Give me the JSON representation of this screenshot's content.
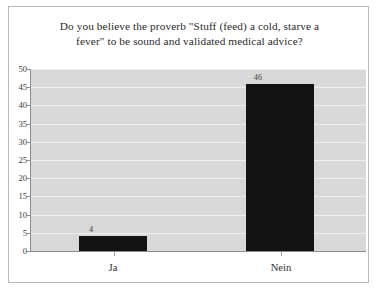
{
  "chart_data": {
    "type": "bar",
    "title": "Do you believe the proverb \"Stuff (feed) a cold, starve a fever\" to be sound and validated medical advice?",
    "title_lines": [
      "Do you believe the proverb \"Stuff (feed) a cold, starve a",
      "fever\" to be sound and validated medical advice?"
    ],
    "categories": [
      "Ja",
      "Nein"
    ],
    "values": [
      4,
      46
    ],
    "data_labels": [
      "4",
      "46"
    ],
    "xlabel": "",
    "ylabel": "",
    "ylim": [
      0,
      50
    ],
    "ytick_step": 5,
    "ytick_labels": [
      "50",
      "45",
      "40",
      "35",
      "30",
      "25",
      "20",
      "15",
      "10",
      "5",
      "0"
    ],
    "grid": true,
    "legend": false,
    "bar_color": "#121212",
    "plot_background": "#d8d8d8",
    "gridline_color": "#efefef",
    "axis_color": "#8d8d8d",
    "figure_border_color": "#b9b9b9"
  }
}
